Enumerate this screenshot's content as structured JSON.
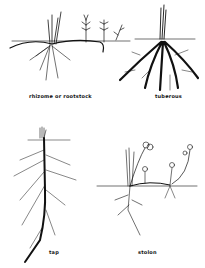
{
  "diagram": {
    "panels": [
      {
        "id": "rhizome",
        "label": "rhizome or rootstock"
      },
      {
        "id": "tuberous",
        "label": "tuberous"
      },
      {
        "id": "tap",
        "label": "tap"
      },
      {
        "id": "stolon",
        "label": "stolon"
      }
    ],
    "ink_color": "#111111",
    "background": "#ffffff"
  }
}
